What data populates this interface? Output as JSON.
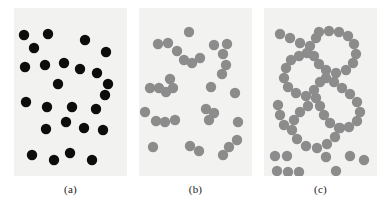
{
  "figure": {
    "background_color": "#ffffff",
    "panel_background_color": "#f2f2f0",
    "panel_count": 3,
    "panel_width": 113,
    "panel_height": 168,
    "dot_radius": 5.2
  },
  "captions": {
    "a": "(a)",
    "b": "(b)",
    "c": "(c)"
  },
  "chart_data": [
    {
      "type": "scatter",
      "title": "(a)",
      "xlabel": "",
      "ylabel": "",
      "xlim": [
        0,
        113
      ],
      "ylim": [
        0,
        168
      ],
      "grid": false,
      "legend": "none",
      "marker": "filled-circle",
      "marker_radius": 5.2,
      "color": "#0d0d0d",
      "n_points": 25,
      "description": "Uniformly scattered random point pattern, black filled circles",
      "points": [
        [
          10,
          27
        ],
        [
          34,
          26
        ],
        [
          71,
          32
        ],
        [
          20,
          40
        ],
        [
          92,
          44
        ],
        [
          11,
          59
        ],
        [
          31,
          57
        ],
        [
          50,
          55
        ],
        [
          66,
          61
        ],
        [
          83,
          65
        ],
        [
          44,
          76
        ],
        [
          94,
          76
        ],
        [
          12,
          94
        ],
        [
          33,
          99
        ],
        [
          58,
          99
        ],
        [
          82,
          101
        ],
        [
          91,
          87
        ],
        [
          32,
          121
        ],
        [
          52,
          114
        ],
        [
          70,
          120
        ],
        [
          89,
          122
        ],
        [
          18,
          147
        ],
        [
          40,
          152
        ],
        [
          56,
          145
        ],
        [
          78,
          152
        ]
      ]
    },
    {
      "type": "scatter",
      "title": "(b)",
      "xlabel": "",
      "ylabel": "",
      "xlim": [
        0,
        113
      ],
      "ylim": [
        0,
        168
      ],
      "grid": false,
      "legend": "none",
      "marker": "filled-circle",
      "marker_radius": 5.2,
      "color": "#8c8c8c",
      "n_points": 33,
      "description": "Moderately clustered point pattern with small aggregates of 2-4 touching circles, gray filled circles",
      "points": [
        [
          50,
          24
        ],
        [
          19,
          36
        ],
        [
          29,
          35
        ],
        [
          38,
          43
        ],
        [
          45,
          52
        ],
        [
          53,
          55
        ],
        [
          61,
          50
        ],
        [
          75,
          37
        ],
        [
          88,
          36
        ],
        [
          84,
          46
        ],
        [
          87,
          57
        ],
        [
          83,
          66
        ],
        [
          31,
          71
        ],
        [
          34,
          80
        ],
        [
          27,
          84
        ],
        [
          11,
          80
        ],
        [
          20,
          80
        ],
        [
          72,
          79
        ],
        [
          96,
          85
        ],
        [
          6,
          104
        ],
        [
          67,
          101
        ],
        [
          75,
          105
        ],
        [
          70,
          112
        ],
        [
          17,
          113
        ],
        [
          26,
          114
        ],
        [
          36,
          112
        ],
        [
          99,
          114
        ],
        [
          14,
          139
        ],
        [
          51,
          138
        ],
        [
          60,
          143
        ],
        [
          90,
          139
        ],
        [
          98,
          132
        ],
        [
          84,
          147
        ]
      ]
    },
    {
      "type": "scatter",
      "title": "(c)",
      "xlabel": "",
      "ylabel": "",
      "xlim": [
        0,
        113
      ],
      "ylim": [
        0,
        168
      ],
      "grid": false,
      "legend": "none",
      "marker": "filled-circle",
      "marker_radius": 5.2,
      "color": "#8c8c8c",
      "n_points": 62,
      "description": "Strongly clustered / regular pattern: circles form connected chains tracing two large ring-shaped loops, plus a few isolated circles near the bottom",
      "points": [
        [
          16,
          26
        ],
        [
          26,
          30
        ],
        [
          36,
          35
        ],
        [
          46,
          38
        ],
        [
          52,
          30
        ],
        [
          55,
          24
        ],
        [
          65,
          23
        ],
        [
          75,
          24
        ],
        [
          84,
          28
        ],
        [
          90,
          36
        ],
        [
          92,
          46
        ],
        [
          89,
          55
        ],
        [
          82,
          62
        ],
        [
          72,
          65
        ],
        [
          62,
          62
        ],
        [
          55,
          56
        ],
        [
          50,
          48
        ],
        [
          43,
          45
        ],
        [
          35,
          48
        ],
        [
          27,
          52
        ],
        [
          22,
          60
        ],
        [
          20,
          70
        ],
        [
          24,
          79
        ],
        [
          32,
          85
        ],
        [
          42,
          88
        ],
        [
          50,
          82
        ],
        [
          56,
          74
        ],
        [
          62,
          70
        ],
        [
          70,
          74
        ],
        [
          78,
          80
        ],
        [
          86,
          86
        ],
        [
          93,
          94
        ],
        [
          96,
          104
        ],
        [
          93,
          113
        ],
        [
          85,
          119
        ],
        [
          75,
          120
        ],
        [
          66,
          115
        ],
        [
          60,
          107
        ],
        [
          56,
          98
        ],
        [
          52,
          90
        ],
        [
          44,
          98
        ],
        [
          36,
          104
        ],
        [
          30,
          112
        ],
        [
          28,
          122
        ],
        [
          33,
          131
        ],
        [
          42,
          138
        ],
        [
          53,
          140
        ],
        [
          63,
          136
        ],
        [
          71,
          129
        ],
        [
          76,
          120
        ],
        [
          14,
          97
        ],
        [
          16,
          107
        ],
        [
          20,
          117
        ],
        [
          11,
          148
        ],
        [
          23,
          148
        ],
        [
          13,
          163
        ],
        [
          24,
          164
        ],
        [
          35,
          164
        ],
        [
          62,
          149
        ],
        [
          86,
          148
        ],
        [
          72,
          163
        ],
        [
          100,
          152
        ]
      ]
    }
  ]
}
